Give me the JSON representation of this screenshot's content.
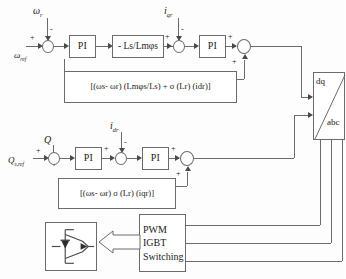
{
  "row1": {
    "input_ref_label": "ωref",
    "feedback_label": "ωr",
    "feedback_sign": "-",
    "ref_sign": "+",
    "pi1_label": "PI",
    "gain_label": "- Ls/Lmφs",
    "current_feedback_label": "iqr",
    "current_feedback_sign": "-",
    "gain_out_sign": "+",
    "pi2_label": "PI",
    "pi2_out_sign": "+",
    "ff_in_sign": "+",
    "feedforward_label": "[(ωs- ωr) (Lmφs/Ls) + σ (Lr) (idr)]"
  },
  "row2": {
    "input_ref_label": "Qs,ref",
    "feedback_label": "Q",
    "feedback_sign": "-",
    "ref_sign": "+",
    "pi1_label": "PI",
    "pi1_out_sign": "+",
    "current_feedback_label": "idr",
    "current_feedback_sign": "-",
    "pi2_label": "PI",
    "pi2_out_sign": "+",
    "ff_in_sign": "+",
    "feedforward_label": "[(ωs- ωr) σ (Lr) (iqr)]"
  },
  "transform": {
    "top_label": "dq",
    "bottom_label": "abc",
    "icon": "dq-abc-transform-block"
  },
  "pwm": {
    "line1": "PWM",
    "line2": "IGBT",
    "line3": "Switching"
  },
  "converter": {
    "icon": "igbt-with-antiparallel-diode-icon"
  },
  "colors": {
    "line": "#6b6b6b",
    "arrow": "#4a4a4a",
    "background": "#fdfdfd",
    "text": "#1a1a1a"
  }
}
